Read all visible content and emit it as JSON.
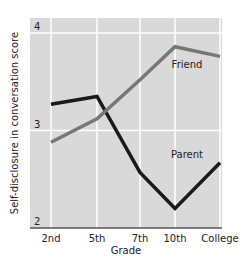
{
  "chart_data": {
    "type": "line",
    "title": "",
    "xlabel": "Grade",
    "ylabel": "Self-disclosure in conversation score",
    "categories": [
      "2nd",
      "5th",
      "7th",
      "10th",
      "College"
    ],
    "yticks": [
      2,
      3,
      4
    ],
    "ylim": [
      2,
      4.15
    ],
    "grid": true,
    "legend": "inline labels",
    "series": [
      {
        "name": "Parent",
        "color": "#1a1a1a",
        "values": [
          3.27,
          3.35,
          2.57,
          2.2,
          2.67
        ]
      },
      {
        "name": "Friend",
        "color": "#777777",
        "values": [
          2.88,
          3.12,
          3.52,
          3.86,
          3.76
        ]
      }
    ]
  },
  "colors": {
    "plot_bg": "#d9d9d9",
    "grid": "#ffffff",
    "axis": "#555555"
  }
}
